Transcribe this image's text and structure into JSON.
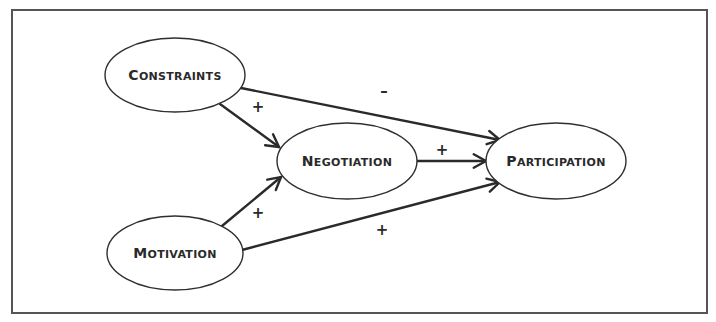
{
  "diagram": {
    "type": "path-model",
    "nodes": [
      {
        "id": "constraints",
        "label": "Constraints"
      },
      {
        "id": "negotiation",
        "label": "Negotiation"
      },
      {
        "id": "participation",
        "label": "Participation"
      },
      {
        "id": "motivation",
        "label": "Motivation"
      }
    ],
    "edges": [
      {
        "from": "constraints",
        "to": "participation",
        "sign": "–"
      },
      {
        "from": "constraints",
        "to": "negotiation",
        "sign": "+"
      },
      {
        "from": "negotiation",
        "to": "participation",
        "sign": "+"
      },
      {
        "from": "motivation",
        "to": "negotiation",
        "sign": "+"
      },
      {
        "from": "motivation",
        "to": "participation",
        "sign": "+"
      }
    ],
    "colors": {
      "stroke": "#2a2a2a",
      "frame": "#555555",
      "background": "#ffffff"
    }
  }
}
